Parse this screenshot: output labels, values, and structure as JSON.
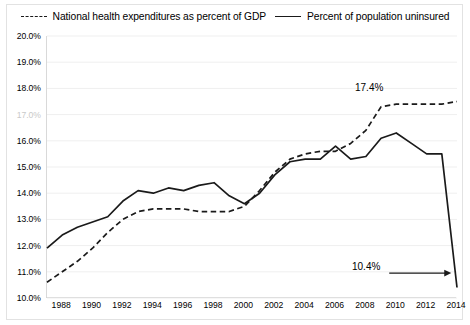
{
  "legend": {
    "items": [
      {
        "label": "National health expenditures as percent of GDP",
        "style": "dashed",
        "name": "nhe"
      },
      {
        "label": "Percent of population uninsured",
        "style": "solid",
        "name": "uninsured"
      }
    ]
  },
  "axes": {
    "y_ticks": [
      "10.0%",
      "11.0%",
      "12.0%",
      "13.0%",
      "14.0%",
      "15.0%",
      "16.0%",
      "17.0%",
      "18.0%",
      "19.0%",
      "20.0%"
    ],
    "x_ticks": [
      "1988",
      "1990",
      "1992",
      "1994",
      "1996",
      "1998",
      "2000",
      "2002",
      "2004",
      "2006",
      "2008",
      "2010",
      "2012",
      "2014"
    ]
  },
  "annotations": {
    "high": "17.4%",
    "low": "10.4%"
  },
  "colors": {
    "line": "#1a1a1a",
    "grid": "#efefef",
    "axis": "#d4d4d4",
    "faded_label": "#c9c9c9"
  },
  "chart_data": {
    "type": "line",
    "title": "",
    "subtitle": "",
    "xlabel": "",
    "ylabel": "",
    "xlim": [
      1987,
      2014
    ],
    "ylim": [
      10.0,
      20.0
    ],
    "ytick_step": 1.0,
    "xtick_step": 2,
    "grid": true,
    "legend_position": "top-center",
    "x": [
      1987,
      1988,
      1989,
      1990,
      1991,
      1992,
      1993,
      1994,
      1995,
      1996,
      1997,
      1998,
      1999,
      2000,
      2001,
      2002,
      2003,
      2004,
      2005,
      2006,
      2007,
      2008,
      2009,
      2010,
      2011,
      2012,
      2013,
      2014
    ],
    "series": [
      {
        "name": "National health expenditures as percent of GDP",
        "style": "dashed",
        "values": [
          10.6,
          11.0,
          11.4,
          11.9,
          12.5,
          13.0,
          13.3,
          13.4,
          13.4,
          13.4,
          13.3,
          13.3,
          13.3,
          13.5,
          14.1,
          14.8,
          15.3,
          15.5,
          15.6,
          15.6,
          15.9,
          16.4,
          17.3,
          17.4,
          17.4,
          17.4,
          17.4,
          17.5
        ],
        "annotated_value": 17.4,
        "annotated_year": 2010
      },
      {
        "name": "Percent of population uninsured",
        "style": "solid",
        "values": [
          11.9,
          12.4,
          12.7,
          12.9,
          13.1,
          13.7,
          14.1,
          14.0,
          14.2,
          14.1,
          14.3,
          14.4,
          13.9,
          13.6,
          14.0,
          14.7,
          15.2,
          15.3,
          15.3,
          15.8,
          15.3,
          15.4,
          16.1,
          16.3,
          15.9,
          15.5,
          15.5,
          10.4
        ],
        "annotated_value": 10.4,
        "annotated_year": 2014
      }
    ]
  }
}
